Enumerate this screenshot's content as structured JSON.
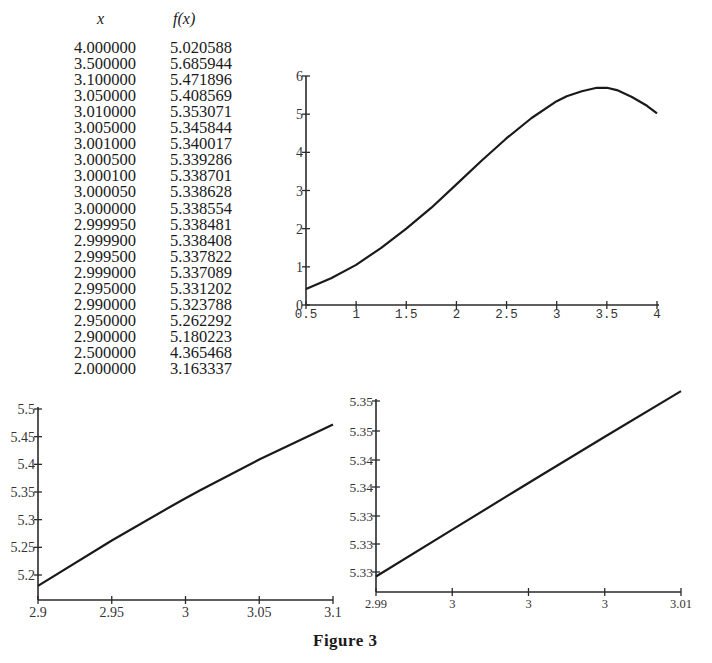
{
  "table": {
    "headers": {
      "x": "x",
      "fx": "f(x)"
    },
    "rows": [
      {
        "x": "4.000000",
        "fx": "5.020588"
      },
      {
        "x": "3.500000",
        "fx": "5.685944"
      },
      {
        "x": "3.100000",
        "fx": "5.471896"
      },
      {
        "x": "3.050000",
        "fx": "5.408569"
      },
      {
        "x": "3.010000",
        "fx": "5.353071"
      },
      {
        "x": "3.005000",
        "fx": "5.345844"
      },
      {
        "x": "3.001000",
        "fx": "5.340017"
      },
      {
        "x": "3.000500",
        "fx": "5.339286"
      },
      {
        "x": "3.000100",
        "fx": "5.338701"
      },
      {
        "x": "3.000050",
        "fx": "5.338628"
      },
      {
        "x": "3.000000",
        "fx": "5.338554"
      },
      {
        "x": "2.999950",
        "fx": "5.338481"
      },
      {
        "x": "2.999900",
        "fx": "5.338408"
      },
      {
        "x": "2.999500",
        "fx": "5.337822"
      },
      {
        "x": "2.999000",
        "fx": "5.337089"
      },
      {
        "x": "2.995000",
        "fx": "5.331202"
      },
      {
        "x": "2.990000",
        "fx": "5.323788"
      },
      {
        "x": "2.950000",
        "fx": "5.262292"
      },
      {
        "x": "2.900000",
        "fx": "5.180223"
      },
      {
        "x": "2.500000",
        "fx": "4.365468"
      },
      {
        "x": "2.000000",
        "fx": "3.163337"
      }
    ]
  },
  "caption": "Figure 3",
  "chart_data": [
    {
      "type": "line",
      "id": "overview",
      "title": "",
      "xlabel": "",
      "ylabel": "",
      "xlim": [
        0.5,
        4
      ],
      "ylim": [
        0,
        6
      ],
      "grid": false,
      "x_ticks": [
        "0.5",
        "1",
        "1.5",
        "2",
        "2.5",
        "3",
        "3.5",
        "4"
      ],
      "y_ticks": [
        "0",
        "1",
        "2",
        "3",
        "4",
        "5",
        "6"
      ],
      "series": [
        {
          "name": "f(x)",
          "x": [
            0.5,
            0.75,
            1.0,
            1.25,
            1.5,
            1.75,
            2.0,
            2.25,
            2.5,
            2.75,
            3.0,
            3.1,
            3.25,
            3.4,
            3.5,
            3.6,
            3.75,
            3.9,
            4.0
          ],
          "y": [
            0.42,
            0.7,
            1.05,
            1.5,
            2.0,
            2.55,
            3.16,
            3.78,
            4.37,
            4.9,
            5.34,
            5.47,
            5.6,
            5.69,
            5.69,
            5.63,
            5.45,
            5.22,
            5.02
          ]
        }
      ]
    },
    {
      "type": "line",
      "id": "zoom-1",
      "title": "",
      "xlabel": "",
      "ylabel": "",
      "xlim": [
        2.9,
        3.1
      ],
      "ylim": [
        5.15,
        5.5
      ],
      "grid": false,
      "x_ticks": [
        "2.9",
        "2.95",
        "3",
        "3.05",
        "3.1"
      ],
      "y_ticks": [
        "5.2",
        "5.25",
        "5.3",
        "5.35",
        "5.4",
        "5.45",
        "5.5"
      ],
      "series": [
        {
          "name": "f(x)",
          "x": [
            2.9,
            2.95,
            2.99,
            3.0,
            3.01,
            3.05,
            3.1
          ],
          "y": [
            5.180223,
            5.262292,
            5.323788,
            5.338554,
            5.353071,
            5.408569,
            5.471896
          ]
        }
      ]
    },
    {
      "type": "line",
      "id": "zoom-2",
      "title": "",
      "xlabel": "",
      "ylabel": "",
      "xlim": [
        2.99,
        3.01
      ],
      "ylim": [
        5.32,
        5.355
      ],
      "grid": false,
      "x_ticks": [
        "2.99",
        "3",
        "3",
        "3",
        "3.01"
      ],
      "y_ticks": [
        "5.33",
        "5.33",
        "5.33",
        "5.34",
        "5.34",
        "5.35",
        "5.35"
      ],
      "series": [
        {
          "name": "f(x)",
          "x": [
            2.99,
            2.995,
            2.999,
            3.0,
            3.001,
            3.005,
            3.01
          ],
          "y": [
            5.323788,
            5.331202,
            5.337089,
            5.338554,
            5.340017,
            5.345844,
            5.353071
          ]
        }
      ]
    }
  ]
}
